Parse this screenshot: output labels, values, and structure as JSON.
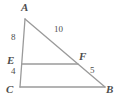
{
  "figure": {
    "type": "geometry-diagram",
    "background_color": "#ffffff",
    "line_color": "#9a9a9a",
    "text_color": "#4d4d4d"
  },
  "vertices": [
    {
      "key": "A",
      "label": "A",
      "name": "vertex-label-a",
      "x": 25,
      "y": 19,
      "label_x": 21,
      "label_y": 2
    },
    {
      "key": "E",
      "label": "E",
      "name": "vertex-label-e",
      "x": 22,
      "y": 64,
      "label_x": 7,
      "label_y": 55
    },
    {
      "key": "C",
      "label": "C",
      "name": "vertex-label-c",
      "x": 20,
      "y": 87,
      "label_x": 6,
      "label_y": 84
    },
    {
      "key": "F",
      "label": "F",
      "name": "vertex-label-f",
      "x": 78,
      "y": 64,
      "label_x": 79,
      "label_y": 51
    },
    {
      "key": "B",
      "label": "B",
      "name": "vertex-label-b",
      "x": 105,
      "y": 87,
      "label_x": 106,
      "label_y": 84
    }
  ],
  "segments": [
    {
      "key": "AB",
      "from": "A",
      "to": "B",
      "name": "segment-ab"
    },
    {
      "key": "AC",
      "from": "A",
      "to": "C",
      "name": "segment-ac"
    },
    {
      "key": "CB",
      "from": "C",
      "to": "B",
      "name": "segment-cb"
    },
    {
      "key": "EF",
      "from": "E",
      "to": "F",
      "name": "segment-ef"
    }
  ],
  "measures": [
    {
      "key": "AE",
      "value": "8",
      "name": "measure-label-ae",
      "x": 11,
      "y": 33
    },
    {
      "key": "EC",
      "value": "4",
      "name": "measure-label-ec",
      "x": 11,
      "y": 67
    },
    {
      "key": "AF",
      "value": "10",
      "name": "measure-label-af",
      "x": 54,
      "y": 25
    },
    {
      "key": "FB",
      "value": "5",
      "name": "measure-label-fb",
      "x": 90,
      "y": 66
    }
  ],
  "chart_data": {
    "type": "diagram",
    "title": "",
    "shape": "triangle-with-midsegment",
    "points": {
      "A": [
        25,
        19
      ],
      "B": [
        105,
        87
      ],
      "C": [
        20,
        87
      ],
      "E": [
        22,
        64
      ],
      "F": [
        78,
        64
      ]
    },
    "edges": [
      [
        "A",
        "B"
      ],
      [
        "A",
        "C"
      ],
      [
        "C",
        "B"
      ],
      [
        "E",
        "F"
      ]
    ],
    "edge_labels": {
      "AE": "8",
      "EC": "4",
      "AF": "10",
      "FB": "5"
    }
  }
}
